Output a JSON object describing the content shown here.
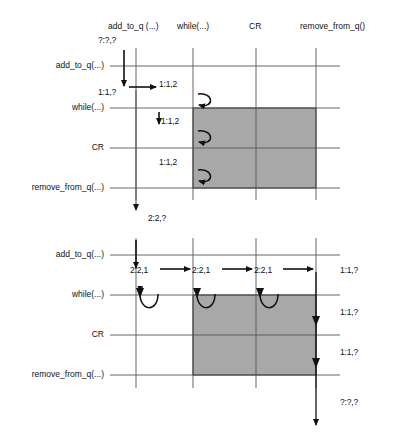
{
  "diagram": {
    "type": "sequence-interaction-diagram",
    "style": {
      "line_color": "#555555",
      "arrow_color": "#111111",
      "shade_color": "#a8a8a8",
      "shade_border": "#4a4a4a",
      "text_color": "#111111",
      "background": "#ffffff"
    },
    "columns": [
      {
        "id": "add_to_q",
        "label": "add_to_q (...)",
        "x": 136
      },
      {
        "id": "while",
        "label": "while(...)",
        "x": 193
      },
      {
        "id": "cr",
        "label": "CR",
        "x": 256
      },
      {
        "id": "remove_from_q",
        "label": "remove_from_q()",
        "x": 316
      }
    ],
    "panels": [
      {
        "id": "upper-panel",
        "rows": [
          {
            "id": "u-row-add",
            "label": "add_to_q(...)",
            "y": 66
          },
          {
            "id": "u-row-while",
            "label": "while(...)",
            "y": 108
          },
          {
            "id": "u-row-cr",
            "label": "CR",
            "y": 148
          },
          {
            "id": "u-row-remove",
            "label": "remove_from_q(...)",
            "y": 188
          }
        ],
        "shaded_regions": [
          {
            "id": "u-shade",
            "x": 193,
            "y": 108,
            "w": 123,
            "h": 80
          }
        ],
        "state_labels": [
          {
            "id": "u-s1",
            "text": "?:?,?",
            "x": 98,
            "y": 40
          },
          {
            "id": "u-s2",
            "text": "1:1,?",
            "x": 98,
            "y": 92
          },
          {
            "id": "u-s3",
            "text": "1:1,2",
            "x": 159,
            "y": 84
          },
          {
            "id": "u-s4",
            "text": "1:1,2",
            "x": 159,
            "y": 122
          },
          {
            "id": "u-s5",
            "text": "1:1,2",
            "x": 159,
            "y": 163
          },
          {
            "id": "u-s6",
            "text": "2:2,?",
            "x": 159,
            "y": 212
          }
        ]
      },
      {
        "id": "lower-panel",
        "rows": [
          {
            "id": "l-row-add",
            "label": "add_to_q(...)",
            "y": 255
          },
          {
            "id": "l-row-while",
            "label": "while(...)",
            "y": 295
          },
          {
            "id": "l-row-cr",
            "label": "CR",
            "y": 335
          },
          {
            "id": "l-row-remove",
            "label": "remove_from_q(...)",
            "y": 375
          }
        ],
        "shaded_regions": [
          {
            "id": "l-shade",
            "x": 193,
            "y": 295,
            "w": 123,
            "h": 80
          }
        ],
        "state_labels": [
          {
            "id": "l-s1",
            "text": "2:2,?",
            "x": 144,
            "y": 212
          },
          {
            "id": "l-s2",
            "text": "2:2,1",
            "x": 130,
            "y": 272
          },
          {
            "id": "l-s3",
            "text": "2:2,1",
            "x": 196,
            "y": 272
          },
          {
            "id": "l-s4",
            "text": "2:2,1",
            "x": 254,
            "y": 272
          },
          {
            "id": "l-s5",
            "text": "1:1,?",
            "x": 343,
            "y": 272
          },
          {
            "id": "l-s6",
            "text": "1:1,?",
            "x": 343,
            "y": 313
          },
          {
            "id": "l-s7",
            "text": "1:1,?",
            "x": 343,
            "y": 353
          },
          {
            "id": "l-s8",
            "text": "?:?,?",
            "x": 343,
            "y": 403
          }
        ]
      }
    ]
  }
}
